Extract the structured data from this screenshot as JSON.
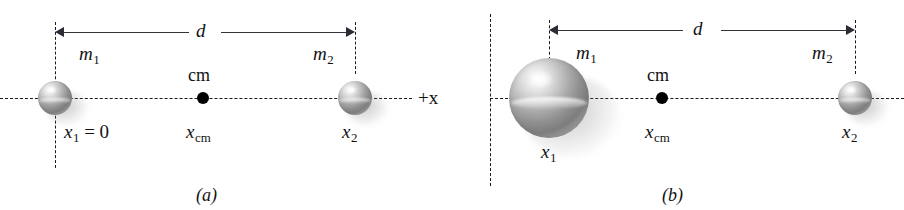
{
  "figure": {
    "panels": [
      {
        "id": "a",
        "caption": "(a)",
        "axis_label": "+x",
        "dimension_label": "d",
        "cm_label": "cm",
        "cm_position_label": "x",
        "cm_position_subscript": "cm",
        "bodies": [
          {
            "mass_label": "m",
            "mass_subscript": "1",
            "position_label": "x",
            "position_subscript": "1",
            "position_value": " = 0",
            "relative_size": "equal"
          },
          {
            "mass_label": "m",
            "mass_subscript": "2",
            "position_label": "x",
            "position_subscript": "2",
            "position_value": "",
            "relative_size": "equal"
          }
        ]
      },
      {
        "id": "b",
        "caption": "(b)",
        "axis_label": "",
        "dimension_label": "d",
        "cm_label": "cm",
        "cm_position_label": "x",
        "cm_position_subscript": "cm",
        "bodies": [
          {
            "mass_label": "m",
            "mass_subscript": "1",
            "position_label": "x",
            "position_subscript": "1",
            "position_value": "",
            "relative_size": "large"
          },
          {
            "mass_label": "m",
            "mass_subscript": "2",
            "position_label": "x",
            "position_subscript": "2",
            "position_value": "",
            "relative_size": "small"
          }
        ]
      }
    ],
    "colors": {
      "line": "#1a1a1a",
      "arrow": "#2b2b33",
      "text": "#121212",
      "background": "#ffffff"
    }
  }
}
